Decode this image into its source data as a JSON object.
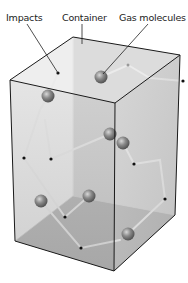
{
  "labels": {
    "impacts": "Impacts",
    "container": "Container",
    "gas_molecules": "Gas molecules"
  },
  "colors": {
    "background": "#ffffff",
    "box_edge": "#1a1a1a",
    "top_face": "#dcdcdc",
    "front_face": "#b8b8b8",
    "right_face": "#c8c8c8",
    "floor": "#a9a9a9",
    "path": "#f5f5f5",
    "molecule": "#7a7a7a",
    "impact_dot": "#111111"
  }
}
